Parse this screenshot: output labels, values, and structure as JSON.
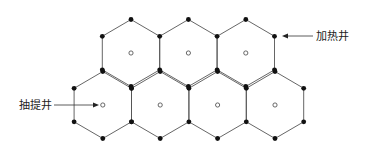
{
  "diagram": {
    "type": "hexagonal-well-pattern",
    "rows": [
      {
        "name": "top-row",
        "hexagon_count": 3
      },
      {
        "name": "bottom-row",
        "hexagon_count": 4
      }
    ],
    "vertex_marker": "heating-well",
    "center_marker": "extraction-well",
    "labels": {
      "heating_well": "加热井",
      "extraction_well": "抽提井"
    },
    "colors": {
      "edge": "#555555",
      "heating_well_dot": "#111111",
      "extraction_well_circle": "#444444"
    }
  }
}
